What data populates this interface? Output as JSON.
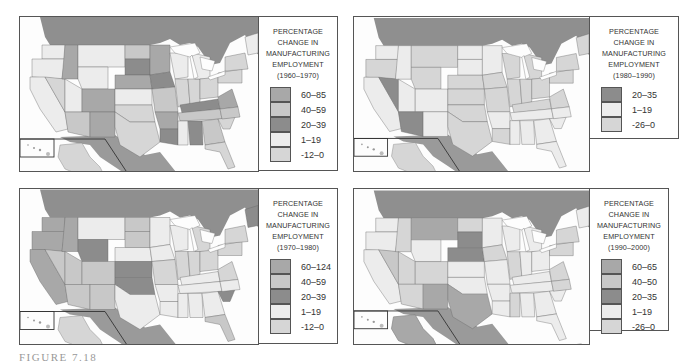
{
  "figure": {
    "caption": "FIGURE 7.18"
  },
  "colors": {
    "canada": "#8f8f8f",
    "mexico": "#9a9a9a",
    "ocean": "#fdfdfd",
    "border": "#555555",
    "class_1": "#a8a8a8",
    "class_2": "#c8c8c8",
    "class_3": "#8c8c8c",
    "class_4": "#ececec",
    "class_5": "#d6d6d6"
  },
  "maps": [
    {
      "id": "1960-1970",
      "legend": {
        "title_lines": [
          "PERCENTAGE",
          "CHANGE IN",
          "MANUFACTURING",
          "EMPLOYMENT",
          "(1960–1970)"
        ],
        "classes": [
          {
            "label": "60–85",
            "color": "#a8a8a8"
          },
          {
            "label": "40–59",
            "color": "#c8c8c8"
          },
          {
            "label": "20–39",
            "color": "#8c8c8c"
          },
          {
            "label": "1–19",
            "color": "#ececec"
          },
          {
            "label": "-12–0",
            "color": "#d6d6d6"
          }
        ]
      }
    },
    {
      "id": "1980-1990",
      "legend": {
        "title_lines": [
          "PERCENTAGE",
          "CHANGE IN",
          "MANUFACTURING",
          "EMPLOYMENT",
          "(1980–1990)"
        ],
        "classes": [
          {
            "label": "20–35",
            "color": "#8c8c8c"
          },
          {
            "label": "1–19",
            "color": "#ececec"
          },
          {
            "label": "-26–0",
            "color": "#d6d6d6"
          }
        ]
      }
    },
    {
      "id": "1970-1980",
      "legend": {
        "title_lines": [
          "PERCENTAGE",
          "CHANGE IN",
          "MANUFACTURING",
          "EMPLOYMENT",
          "(1970–1980)"
        ],
        "classes": [
          {
            "label": "60–124",
            "color": "#a8a8a8"
          },
          {
            "label": "40–59",
            "color": "#c8c8c8"
          },
          {
            "label": "20–39",
            "color": "#8c8c8c"
          },
          {
            "label": "1–19",
            "color": "#ececec"
          },
          {
            "label": "-12–0",
            "color": "#d6d6d6"
          }
        ]
      }
    },
    {
      "id": "1990-2000",
      "legend": {
        "title_lines": [
          "PERCENTAGE",
          "CHANGE IN",
          "MANUFACTURING",
          "EMPLOYMENT",
          "(1990–2000)"
        ],
        "classes": [
          {
            "label": "60–65",
            "color": "#a8a8a8"
          },
          {
            "label": "40–50",
            "color": "#c8c8c8"
          },
          {
            "label": "20–35",
            "color": "#8c8c8c"
          },
          {
            "label": "1–19",
            "color": "#ececec"
          },
          {
            "label": "-26–0",
            "color": "#d6d6d6"
          }
        ]
      }
    }
  ]
}
